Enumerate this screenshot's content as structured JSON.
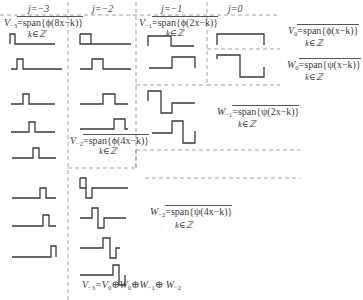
{
  "diagram": {
    "column_headers": [
      {
        "j": "j=−3",
        "x": 30
      },
      {
        "j": "j=−2",
        "x": 95
      },
      {
        "j": "j=−1",
        "x": 164
      },
      {
        "j": "j=0",
        "x": 224
      }
    ],
    "labels": {
      "v_minus3": {
        "lhs": "V",
        "sub": "−3",
        "rhs": "=span{ϕ(8x−k)}",
        "k": "k∈ℤ"
      },
      "v_minus2": {
        "lhs": "V",
        "sub": "−2",
        "rhs": "=span{ϕ(4x−k)}",
        "k": "k∈ℤ"
      },
      "v_minus1": {
        "lhs": "V",
        "sub": "−1",
        "rhs": "=span{ϕ(2x−k)}",
        "k": "k∈ℤ"
      },
      "v_0": {
        "lhs": "V",
        "sub": "0",
        "rhs": "=span{ϕ(x−k)}",
        "k": "k∈ℤ"
      },
      "w_0": {
        "lhs": "W",
        "sub": "0",
        "rhs": "=span{ψ(x−k)}",
        "k": "k∈ℤ"
      },
      "w_minus1": {
        "lhs": "W",
        "sub": "−1",
        "rhs": "=span{ψ(2x−k)}",
        "k": "k∈ℤ"
      },
      "w_minus2": {
        "lhs": "W",
        "sub": "−2",
        "rhs": "=span{ψ(4x−k)}",
        "k": "k∈ℤ"
      }
    },
    "equation": {
      "text": "V₋₃=V₀⊕W₀⊕W₋₁⊕W₋₂",
      "parts": [
        "V",
        "−3",
        "=V",
        "0",
        "⊕W",
        "0",
        "⊕W",
        "−1",
        "⊕ W",
        "−2"
      ]
    },
    "colors": {
      "line": "#3a3a3a",
      "dash": "#8a8a8a",
      "text": "#3a3a3a"
    }
  }
}
